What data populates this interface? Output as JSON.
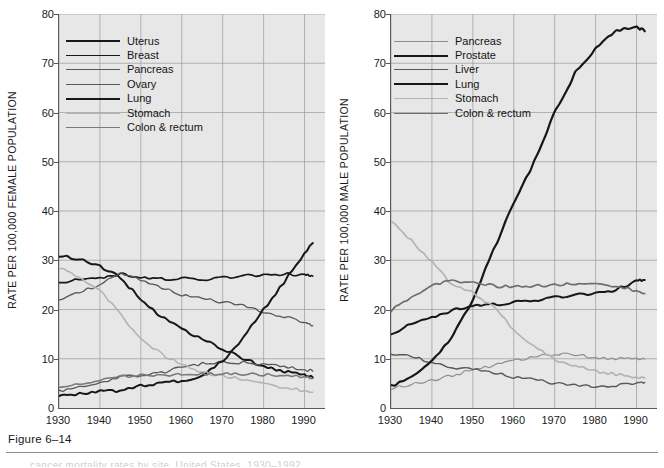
{
  "figure": {
    "caption": "Figure 6–14",
    "footer_sliver": "cancer mortality rates by site, United States, 1930–1992"
  },
  "colors": {
    "plot_background": "#e7e7e7",
    "grid": "#9a9a9a",
    "axis": "#5a5a5a",
    "dark": "#171717",
    "medium": "#575757",
    "light": "#b4b4b4"
  },
  "chart_data": [
    {
      "type": "line",
      "title": "",
      "panel": "female",
      "xlabel": "",
      "ylabel": "RATE PER 100,000 FEMALE POPULATION",
      "xlim": [
        1930,
        1995
      ],
      "ylim": [
        0,
        80
      ],
      "xticks": [
        1930,
        1940,
        1950,
        1960,
        1970,
        1980,
        1990
      ],
      "yticks": [
        0,
        10,
        20,
        30,
        40,
        50,
        60,
        70,
        80
      ],
      "grid": true,
      "legend_position": "upper-left",
      "x": [
        1930,
        1935,
        1940,
        1945,
        1950,
        1955,
        1960,
        1965,
        1970,
        1975,
        1980,
        1985,
        1990,
        1992
      ],
      "series": [
        {
          "name": "Uterus",
          "color": "#171717",
          "width": 2.0,
          "values": [
            31.0,
            30.2,
            28.8,
            26.5,
            22.0,
            18.5,
            16.0,
            14.0,
            12.0,
            10.0,
            8.5,
            7.4,
            6.6,
            6.2
          ]
        },
        {
          "name": "Breast",
          "color": "#171717",
          "width": 1.7,
          "values": [
            25.5,
            26.0,
            26.5,
            27.2,
            26.5,
            26.2,
            26.3,
            26.0,
            26.5,
            26.8,
            27.0,
            27.2,
            27.0,
            26.8
          ]
        },
        {
          "name": "Pancreas",
          "color": "#575757",
          "width": 1.3,
          "values": [
            22.0,
            23.5,
            25.0,
            27.5,
            26.0,
            24.5,
            23.0,
            22.2,
            21.5,
            20.8,
            19.5,
            18.6,
            17.4,
            16.7
          ]
        },
        {
          "name": "Ovary",
          "color": "#575757",
          "width": 1.3,
          "values": [
            3.5,
            4.2,
            5.0,
            6.4,
            6.6,
            7.2,
            8.2,
            9.0,
            9.3,
            9.2,
            8.9,
            8.3,
            7.8,
            7.5
          ]
        },
        {
          "name": "Lung",
          "color": "#171717",
          "width": 2.0,
          "values": [
            2.5,
            2.9,
            3.3,
            3.5,
            4.6,
            5.0,
            5.6,
            6.5,
            9.5,
            14.2,
            20.0,
            25.5,
            31.5,
            33.5
          ]
        },
        {
          "name": "Stomach",
          "color": "#b4b4b4",
          "width": 1.6,
          "values": [
            28.5,
            26.5,
            24.0,
            19.0,
            14.0,
            11.0,
            8.8,
            7.3,
            6.5,
            5.8,
            5.0,
            4.2,
            3.5,
            3.2
          ]
        },
        {
          "name": "Colon & rectum",
          "color": "#7a7a7a",
          "width": 1.6,
          "values": [
            4.0,
            4.8,
            5.6,
            6.4,
            6.6,
            6.7,
            6.8,
            6.9,
            7.0,
            6.9,
            6.8,
            6.6,
            6.3,
            6.0
          ]
        }
      ]
    },
    {
      "type": "line",
      "title": "",
      "panel": "male",
      "xlabel": "",
      "ylabel": "RATE PER 100,000 MALE POPULATION",
      "xlim": [
        1930,
        1995
      ],
      "ylim": [
        0,
        80
      ],
      "xticks": [
        1930,
        1940,
        1950,
        1960,
        1970,
        1980,
        1990
      ],
      "yticks": [
        0,
        10,
        20,
        30,
        40,
        50,
        60,
        70,
        80
      ],
      "grid": true,
      "legend_position": "upper-left",
      "x": [
        1930,
        1935,
        1940,
        1945,
        1950,
        1955,
        1960,
        1965,
        1970,
        1975,
        1980,
        1985,
        1990,
        1992
      ],
      "series": [
        {
          "name": "Pancreas",
          "color": "#8e8e8e",
          "width": 1.2,
          "values": [
            4.0,
            4.8,
            5.6,
            6.6,
            7.8,
            8.6,
            9.6,
            10.4,
            11.0,
            10.8,
            10.2,
            10.0,
            9.9,
            9.9
          ]
        },
        {
          "name": "Prostate",
          "color": "#171717",
          "width": 2.0,
          "values": [
            15.0,
            17.0,
            18.5,
            19.8,
            20.8,
            21.0,
            21.4,
            21.8,
            22.5,
            22.9,
            23.3,
            24.0,
            25.8,
            26.0
          ]
        },
        {
          "name": "Liver",
          "color": "#575757",
          "width": 1.4,
          "values": [
            11.0,
            10.5,
            9.2,
            8.2,
            8.0,
            7.2,
            6.3,
            5.8,
            5.0,
            4.6,
            4.4,
            4.6,
            5.1,
            5.2
          ]
        },
        {
          "name": "Lung",
          "color": "#171717",
          "width": 2.2,
          "values": [
            4.5,
            6.2,
            9.5,
            14.5,
            22.0,
            32.0,
            41.5,
            50.0,
            60.0,
            68.0,
            73.0,
            76.5,
            77.5,
            76.5
          ]
        },
        {
          "name": "Stomach",
          "color": "#b4b4b4",
          "width": 1.7,
          "values": [
            38.0,
            34.0,
            29.5,
            25.0,
            23.5,
            20.5,
            16.0,
            12.5,
            9.8,
            8.5,
            7.5,
            6.8,
            6.3,
            6.1
          ]
        },
        {
          "name": "Colon & rectum",
          "color": "#6e6e6e",
          "width": 1.7,
          "values": [
            19.8,
            22.5,
            25.0,
            25.8,
            25.5,
            24.8,
            24.6,
            24.8,
            25.0,
            25.2,
            25.2,
            24.8,
            23.8,
            23.2
          ]
        }
      ]
    }
  ]
}
